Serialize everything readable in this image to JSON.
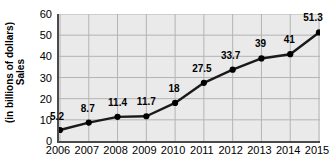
{
  "chart_data": {
    "type": "line",
    "title": "",
    "xlabel": "",
    "ylabel": "Sales (in billions of dollars)",
    "ylabel_lines": [
      "Sales",
      "(in billions of dollars)"
    ],
    "categories": [
      "2006",
      "2007",
      "2008",
      "2009",
      "2010",
      "2011",
      "2012",
      "2013",
      "2014",
      "2015"
    ],
    "values": [
      5.2,
      8.7,
      11.4,
      11.7,
      18,
      27.5,
      33.7,
      39,
      41,
      51.3
    ],
    "point_labels": [
      "5.2",
      "8.7",
      "11.4",
      "11.7",
      "18",
      "27.5",
      "33.7",
      "39",
      "41",
      "51.3"
    ],
    "ylim": [
      0,
      60
    ],
    "y_ticks": [
      0,
      10,
      20,
      30,
      40,
      50,
      60
    ],
    "y_tick_labels": [
      "0",
      "10",
      "20",
      "30",
      "40",
      "50",
      "60"
    ],
    "grid": true,
    "legend": "none",
    "line_color": "#1a1a1a",
    "marker_color": "#000000",
    "plot_background": "#eaeaea",
    "gridline_color": "#b4b4b4",
    "axis_color": "#4a4a4a"
  }
}
